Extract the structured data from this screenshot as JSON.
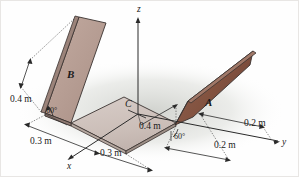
{
  "figure": {
    "axes": {
      "x_label": "x",
      "y_label": "y",
      "z_label": "z"
    },
    "points": {
      "centroid_label": "C"
    },
    "plates": {
      "plate_a_label": "A",
      "plate_b_label": "B"
    },
    "dimensions": {
      "plate_b_height": "0.4 m",
      "center_half_width": "0.4 m",
      "base_x_left": "0.3 m",
      "base_x_right": "0.3 m",
      "base_y_near": "0.2 m",
      "base_y_far": "0.2 m"
    },
    "angles": {
      "plate_b_angle": "60°",
      "plate_a_angle": "60°"
    },
    "colors": {
      "plate_b_face": "#b9a096",
      "plate_a_face": "#8a5a4a",
      "base_face": "#cfc2bd",
      "edge": "#3a3230",
      "line": "#2a2a2a",
      "shadow": "#d9dad6",
      "background": "#fefefe"
    }
  }
}
